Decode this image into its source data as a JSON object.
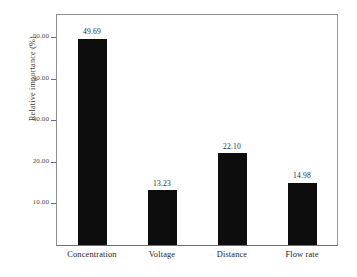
{
  "chart_data": {
    "type": "bar",
    "title": "",
    "xlabel": "",
    "ylabel": "Relative importance (%)",
    "categories": [
      "Concentration",
      "Voltage",
      "Distance",
      "Flow rate"
    ],
    "values": [
      49.69,
      13.23,
      22.1,
      14.98
    ],
    "value_labels": [
      "49.69",
      "13.23",
      "22.10",
      "14.98"
    ],
    "ylim": [
      0,
      55.6
    ],
    "yticks": [
      10,
      20,
      30,
      40,
      50
    ],
    "ytick_labels": [
      "10.00",
      "20.00",
      "30.00",
      "40.00",
      "50.00"
    ],
    "grid": false,
    "legend": false,
    "bar_color": "#0d0d0d",
    "frame_color": "#8d8d8d",
    "background": "#ffffff"
  }
}
